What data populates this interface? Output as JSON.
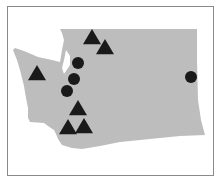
{
  "map": {
    "region": "Washington State",
    "colors": {
      "land": "#bdbdbd",
      "marker": "#1a1a1a",
      "frame": "#8a8a8a",
      "background": "#ffffff"
    },
    "markers": [
      {
        "shape": "triangle",
        "x": 92,
        "y": 38
      },
      {
        "shape": "triangle",
        "x": 105,
        "y": 48
      },
      {
        "shape": "triangle",
        "x": 37,
        "y": 74
      },
      {
        "shape": "triangle",
        "x": 78,
        "y": 109
      },
      {
        "shape": "triangle",
        "x": 68,
        "y": 128
      },
      {
        "shape": "triangle",
        "x": 84,
        "y": 127
      },
      {
        "shape": "circle",
        "x": 78,
        "y": 63
      },
      {
        "shape": "circle",
        "x": 74,
        "y": 79
      },
      {
        "shape": "circle",
        "x": 67,
        "y": 91
      },
      {
        "shape": "circle",
        "x": 191,
        "y": 77
      }
    ]
  }
}
